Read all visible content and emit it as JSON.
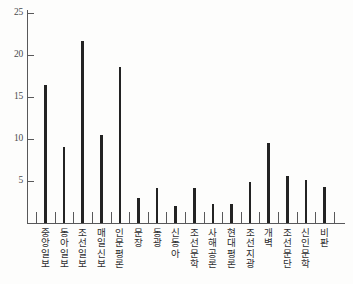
{
  "chart_data": {
    "type": "bar",
    "title": "",
    "subtitle": "",
    "xlabel": "",
    "ylabel": "",
    "ylim": [
      0,
      27
    ],
    "yticks": [
      5,
      10,
      15,
      20,
      25
    ],
    "grid": false,
    "legend": null,
    "orientation": "vertical",
    "bar_style": "thin-line",
    "categories": [
      "중앙일보",
      "동아일보",
      "조선일보",
      "매일신보",
      "인문평론",
      "문장",
      "동광",
      "신동아",
      "조선문학",
      "사해공론",
      "현대평론",
      "조선지광",
      "개벽",
      "조선문단",
      "신인문학",
      "비판"
    ],
    "values": [
      16.4,
      9.0,
      21.6,
      10.5,
      18.5,
      3.0,
      4.1,
      2.0,
      4.1,
      2.2,
      2.2,
      4.9,
      9.5,
      5.6,
      5.1,
      4.3
    ],
    "colors": {
      "bar": "#232323",
      "axis": "#58585a",
      "tick_label": "#4a4a4c",
      "category_label": "#2e2e30",
      "background": "#fdfdfc"
    }
  }
}
